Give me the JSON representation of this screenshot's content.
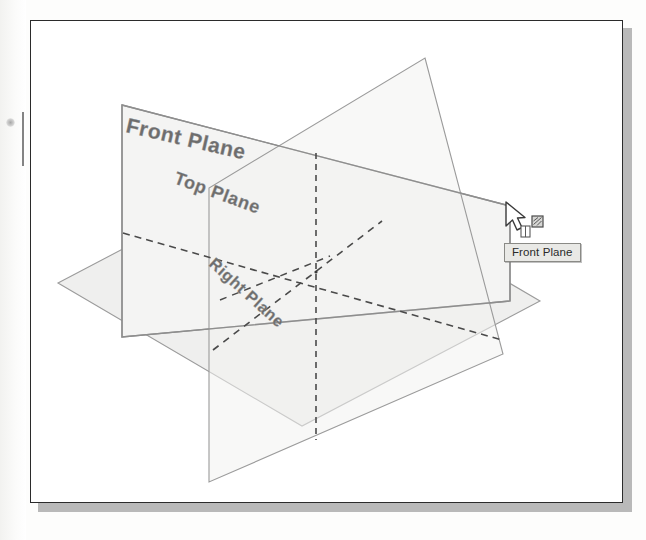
{
  "figure": {
    "kind": "cad-viewport-screenshot",
    "frame": {
      "border_color": "#2b2b2b",
      "shadow_color": "#b9b9b9",
      "background": "#ffffff"
    }
  },
  "planes": [
    {
      "id": "front-plane",
      "label": "Front Plane",
      "label_rotation_deg": 13,
      "label_font_size": 21,
      "fill": "#f4f4f3",
      "stroke": "#8e8e8e",
      "highlighted": true
    },
    {
      "id": "top-plane",
      "label": "Top Plane",
      "label_rotation_deg": 20,
      "label_font_size": 18,
      "fill": "#efefee",
      "stroke": "#9b9b9b",
      "highlighted": false
    },
    {
      "id": "right-plane",
      "label": "Right Plane",
      "label_rotation_deg": 42,
      "label_font_size": 16,
      "fill": "#f2f2f1",
      "stroke": "#9b9b9b",
      "highlighted": false
    }
  ],
  "centerlines": {
    "style": "dashed",
    "color": "#4a4a4a",
    "origin_label": "origin"
  },
  "cursor": {
    "type": "arrow-with-plane-badge",
    "badge_icon": "plane-select-icon",
    "position": {
      "x": 508,
      "y": 206
    }
  },
  "tooltip": {
    "text": "Front Plane",
    "background": "#e9e9e6",
    "border": "#8a8a86",
    "text_color": "#2a2a2a"
  }
}
